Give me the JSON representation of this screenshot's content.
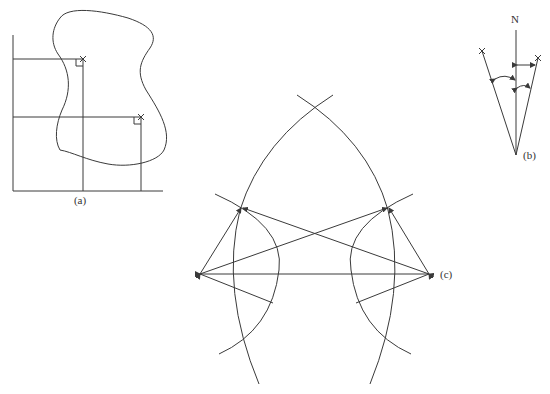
{
  "figure": {
    "panels": [
      {
        "id": "a",
        "label": "(a)",
        "description": "Irregular closed boundary with two points fixed by perpendicular offsets from two baselines"
      },
      {
        "id": "b",
        "label": "(b)",
        "north_label": "N",
        "description": "Two points fixed by bearings/angles measured from north line at a station"
      },
      {
        "id": "c",
        "label": "(c)",
        "description": "Construction of two points by intersecting arcs from two base stations with connecting rays"
      }
    ],
    "colors": {
      "line": "#3a3a3a",
      "background": "#ffffff"
    }
  }
}
